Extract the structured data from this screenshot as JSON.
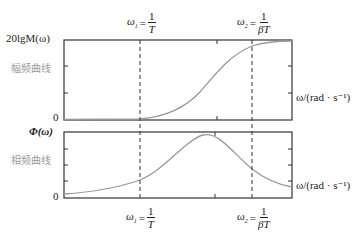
{
  "figure": {
    "top_panel": {
      "y_label": "20lgM(ω)",
      "side_label": "幅频曲线",
      "zero_label": "0",
      "x_axis_label": "ω/(rad · s⁻¹)"
    },
    "bottom_panel": {
      "y_label": "Φ(ω)",
      "side_label": "相频曲线",
      "zero_label": "0",
      "x_axis_label": "ω/(rad · s⁻¹)"
    },
    "markers": {
      "omega1": {
        "symbol": "ω",
        "sub": "1",
        "eq": "=",
        "num": "1",
        "den": "T"
      },
      "omega2": {
        "symbol": "ω",
        "sub": "2",
        "eq": "=",
        "num": "1",
        "den": "βT"
      }
    },
    "colors": {
      "axis": "#333333",
      "curve": "#999999",
      "dashed": "#333333",
      "side_label": "#9a9a9a"
    }
  }
}
